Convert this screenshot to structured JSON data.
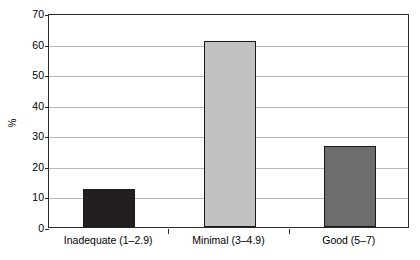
{
  "chart_data": {
    "type": "bar",
    "title": "",
    "subtitle": "",
    "xlabel": "",
    "ylabel": "%",
    "categories": [
      "Inadequate (1–2.9)",
      "Minimal (3–4.9)",
      "Good (5–7)"
    ],
    "values": [
      12.3,
      60.8,
      26.5
    ],
    "series": [
      {
        "name": "Percent",
        "values": [
          12.3,
          60.8,
          26.5
        ]
      }
    ],
    "ylim": [
      0,
      70
    ],
    "yticks": [
      0,
      10,
      20,
      30,
      40,
      50,
      60,
      70
    ],
    "ytick_labels": [
      "0",
      "10",
      "20",
      "30",
      "40",
      "50",
      "60",
      "70"
    ],
    "grid": "horizontal",
    "legend": "none",
    "bar_colors": [
      "#231f20",
      "#c2c2c2",
      "#6d6d6d"
    ],
    "bar_edge_color": "#1a1a1a",
    "axis_color": "#2b2b2b",
    "grid_color": "#b9b9b9",
    "background_color": "#ffffff"
  }
}
